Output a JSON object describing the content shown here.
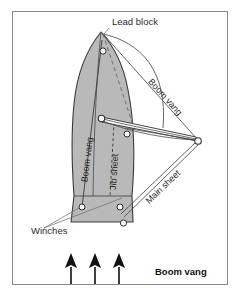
{
  "figure": {
    "title": "Boom vang",
    "caption_position": "bottom-right",
    "frame_color": "#8a8a8a",
    "background_color": "#ffffff",
    "hull_fill_color": "#b9b9b9",
    "hull_stroke_color": "#3a3a3a",
    "line_color": "#4a4a4a",
    "arrow_color": "#111111",
    "label_color": "#2b2b2b"
  },
  "labels": {
    "lead_block": "Lead block",
    "boom_vang_deck": "Boom vang",
    "boom_vang_diagonal": "Boom vang",
    "jib_sheet": "Jib sheet",
    "main_sheet": "Main sheet",
    "winches": "Winches",
    "caption": "Boom vang"
  },
  "diagram_data": {
    "type": "technical-illustration",
    "subject": "sailboat deck plan showing boom vang rigging",
    "view": "plan view from above, bow at top",
    "annotated_parts": [
      "Lead block",
      "Boom vang",
      "Jib sheet",
      "Main sheet",
      "Winches"
    ],
    "wind_arrows": {
      "count": 3,
      "direction": "up",
      "meaning": "wind direction from astern"
    },
    "fittings": {
      "deck_circles": 6,
      "boom_end_circle": 1
    }
  }
}
